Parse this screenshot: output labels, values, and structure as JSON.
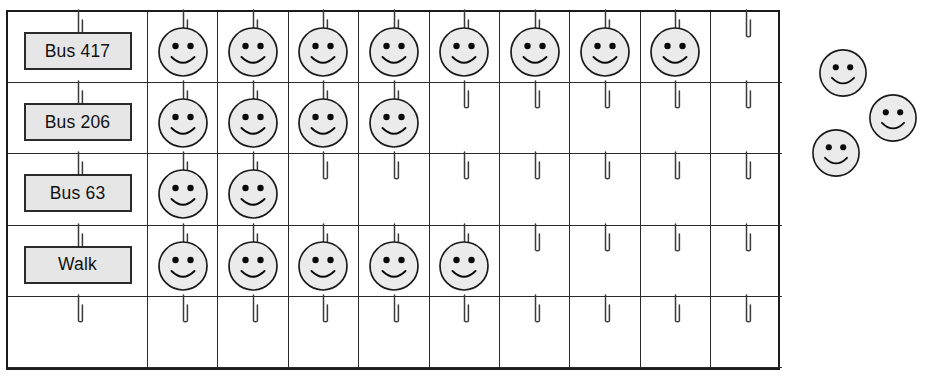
{
  "chart_data": {
    "type": "bar",
    "subtype": "pictograph",
    "title": "",
    "xlabel": "",
    "ylabel": "",
    "categories": [
      "Bus 417",
      "Bus 206",
      "Bus 63",
      "Walk"
    ],
    "values": [
      8,
      4,
      2,
      5
    ],
    "unit_symbol": "smiley-face",
    "unit_value": 1,
    "columns": 10,
    "rows": 5,
    "empty_row_index": 4,
    "grid": true,
    "legend": "none",
    "loose_symbols_count": 3,
    "series": [
      {
        "name": "People",
        "values": [
          8,
          4,
          2,
          5
        ]
      }
    ]
  },
  "chart": {
    "row_labels": [
      "Bus 417",
      "Bus 206",
      "Bus 63",
      "Walk",
      ""
    ],
    "row_counts": [
      8,
      4,
      2,
      5,
      0
    ],
    "column_count": 10,
    "hook_icon": "hook-icon",
    "face_icon": "smiley-face-icon",
    "plaque_icon": "label-plaque"
  },
  "loose_faces": [
    {
      "name": "loose-face-1",
      "x": 818,
      "y": 48,
      "size": 50
    },
    {
      "name": "loose-face-2",
      "x": 868,
      "y": 93,
      "size": 50
    },
    {
      "name": "loose-face-3",
      "x": 811,
      "y": 128,
      "size": 50
    }
  ],
  "colors": {
    "face_fill": "#ebebeb",
    "face_stroke": "#1a1a1a",
    "plaque_fill": "#e6e6e6",
    "plaque_stroke": "#2b2b2b",
    "grid_line": "#2a2a2a",
    "grid_border": "#1c1c1c",
    "hook_stroke": "#3a3a3a",
    "background": "#ffffff"
  }
}
